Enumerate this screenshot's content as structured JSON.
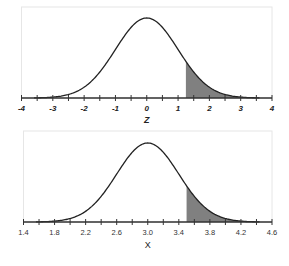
{
  "chart_data": [
    {
      "type": "area",
      "title": "",
      "xlabel": "Z",
      "ylabel": "",
      "distribution": "standard normal",
      "mean": 0,
      "sd": 1,
      "xlim": [
        -4,
        4
      ],
      "tick_labels": [
        "-4",
        "-3",
        "-2",
        "-1",
        "0",
        "1",
        "2",
        "3",
        "4"
      ],
      "tick_values": [
        -4,
        -3,
        -2,
        -1,
        0,
        1,
        2,
        3,
        4
      ],
      "minor_tick_step": 0.5,
      "shaded_region": {
        "from": 1.25,
        "to": 4
      },
      "grid": false,
      "legend": null
    },
    {
      "type": "area",
      "title": "",
      "xlabel": "X",
      "ylabel": "",
      "distribution": "normal",
      "mean": 3.0,
      "sd": 0.4,
      "xlim": [
        1.4,
        4.6
      ],
      "tick_labels": [
        "1.4",
        "1.8",
        "2.2",
        "2.6",
        "3.0",
        "3.4",
        "3.8",
        "4.2",
        "4.6"
      ],
      "tick_values": [
        1.4,
        1.8,
        2.2,
        2.6,
        3.0,
        3.4,
        3.8,
        4.2,
        4.6
      ],
      "minor_tick_step": 0.2,
      "shaded_region": {
        "from": 3.5,
        "to": 4.6
      },
      "grid": false,
      "legend": null
    }
  ],
  "colors": {
    "curve": "#222222",
    "shade": "#808080",
    "axis": "#333333",
    "frame": "#e6e6e6"
  }
}
